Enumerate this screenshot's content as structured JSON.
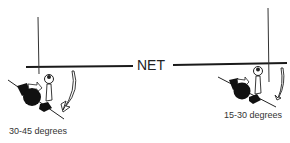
{
  "net": {
    "label": "NET"
  },
  "players": [
    {
      "side": "left",
      "angle_label": "30-45 degrees"
    },
    {
      "side": "right",
      "angle_label": "15-30 degrees"
    }
  ],
  "colors": {
    "line": "#1a1a1a",
    "fill": "#111111",
    "background": "#ffffff"
  }
}
